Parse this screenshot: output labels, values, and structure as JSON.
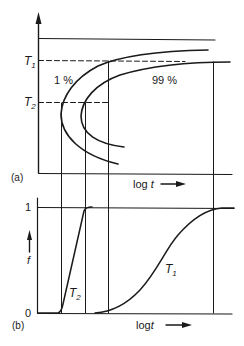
{
  "figure": {
    "panel_a": {
      "label": "(a)",
      "y_symbol_T1": "T",
      "y_symbol_T1_sub": "1",
      "y_symbol_T2": "T",
      "y_symbol_T2_sub": "2",
      "curve_1_label": "1 %",
      "curve_99_label": "99 %",
      "x_axis_label": "log t",
      "x_axis_label_log": "log",
      "x_axis_label_t": "t"
    },
    "panel_b": {
      "label": "(b)",
      "y_axis_symbol": "f",
      "y_tick_top": "1",
      "y_tick_bottom": "0",
      "curve_T2_label": "T",
      "curve_T2_sub": "2",
      "curve_T1_label": "T",
      "curve_T1_sub": "1",
      "x_axis_label_log": "log",
      "x_axis_label_t": "t"
    }
  },
  "colors": {
    "ink": "#1a1a1a",
    "background": "#ffffff"
  }
}
